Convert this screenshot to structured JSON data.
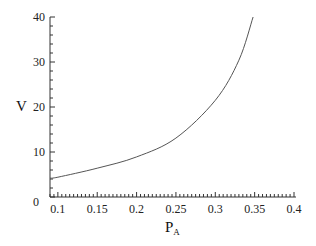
{
  "chart_data": {
    "type": "line",
    "title": "",
    "xlabel": "P",
    "xlabel_subscript": "A",
    "ylabel": "V",
    "xlim": [
      0.09,
      0.4
    ],
    "ylim": [
      0,
      40
    ],
    "x_ticks": [
      0.1,
      0.15,
      0.2,
      0.25,
      0.3,
      0.35,
      0.4
    ],
    "x_tick_labels": [
      "0.1",
      "0.15",
      "0.2",
      "0.25",
      "0.3",
      "0.35",
      "0.4"
    ],
    "y_ticks": [
      0,
      10,
      20,
      30,
      40
    ],
    "y_tick_labels": [
      "0",
      "10",
      "20",
      "30",
      "40"
    ],
    "grid": false,
    "legend": null,
    "series": [
      {
        "name": "V",
        "color": "#555555",
        "x": [
          0.09,
          0.1,
          0.15,
          0.2,
          0.25,
          0.3,
          0.33,
          0.348
        ],
        "y": [
          4.2,
          4.4,
          6.4,
          8.9,
          13.1,
          21.5,
          30.4,
          40
        ]
      }
    ]
  },
  "colors": {
    "axis": "#333333",
    "curve": "#555555",
    "background": "#ffffff"
  }
}
